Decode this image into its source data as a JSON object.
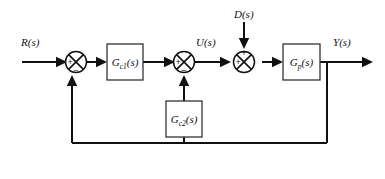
{
  "diagram": {
    "type": "control-system-block-diagram",
    "background_color": "#ffffff",
    "line_color": "#111111",
    "block_fill": "#ffffff",
    "block_stroke": "#333333"
  },
  "signals": {
    "reference": {
      "label": "R(s)",
      "base": "R",
      "sub": "",
      "arg": "(s)"
    },
    "control": {
      "label": "U(s)",
      "base": "U",
      "sub": "",
      "arg": "(s)"
    },
    "disturbance": {
      "label": "D(s)",
      "base": "D",
      "sub": "",
      "arg": "(s)"
    },
    "output": {
      "label": "Y(s)",
      "base": "Y",
      "sub": "",
      "arg": "(s)"
    }
  },
  "blocks": [
    {
      "id": "gc1",
      "label": "Gc1(s)",
      "base": "G",
      "sub": "c1",
      "arg": "(s)",
      "role": "outer-controller"
    },
    {
      "id": "gc2",
      "label": "Gc2(s)",
      "base": "G",
      "sub": "c2",
      "arg": "(s)",
      "role": "inner-feedback-controller"
    },
    {
      "id": "gp",
      "label": "Gp(s)",
      "base": "G",
      "sub": "p",
      "arg": "(s)",
      "role": "plant"
    }
  ],
  "summing_junctions": [
    {
      "id": "sum1",
      "role": "outer-error-junction",
      "signs": {
        "left": "+",
        "bottom": "−",
        "top": "",
        "right": ""
      }
    },
    {
      "id": "sum2",
      "role": "inner-loop-junction",
      "signs": {
        "left": "+",
        "bottom": "−",
        "top": "",
        "right": ""
      }
    },
    {
      "id": "sum3",
      "role": "disturbance-injection-junction",
      "signs": {
        "left": "+",
        "top": "+",
        "bottom": "",
        "right": ""
      }
    }
  ],
  "paths": [
    {
      "id": "input-path",
      "from": "R(s)",
      "to": "sum1"
    },
    {
      "id": "sum1-to-gc1",
      "from": "sum1",
      "to": "gc1"
    },
    {
      "id": "gc1-to-sum2",
      "from": "gc1",
      "to": "sum2"
    },
    {
      "id": "sum2-to-sum3",
      "from": "sum2",
      "to": "sum3",
      "label": "U(s)"
    },
    {
      "id": "disturbance-path",
      "from": "D(s)",
      "to": "sum3"
    },
    {
      "id": "sum3-to-gp",
      "from": "sum3",
      "to": "gp"
    },
    {
      "id": "gp-to-output",
      "from": "gp",
      "to": "Y(s)"
    },
    {
      "id": "inner-feedback",
      "from": "output-takeoff-bus",
      "to": "gc2",
      "then": "sum2"
    },
    {
      "id": "outer-feedback",
      "from": "output-takeoff-bus",
      "to": "sum1"
    }
  ]
}
